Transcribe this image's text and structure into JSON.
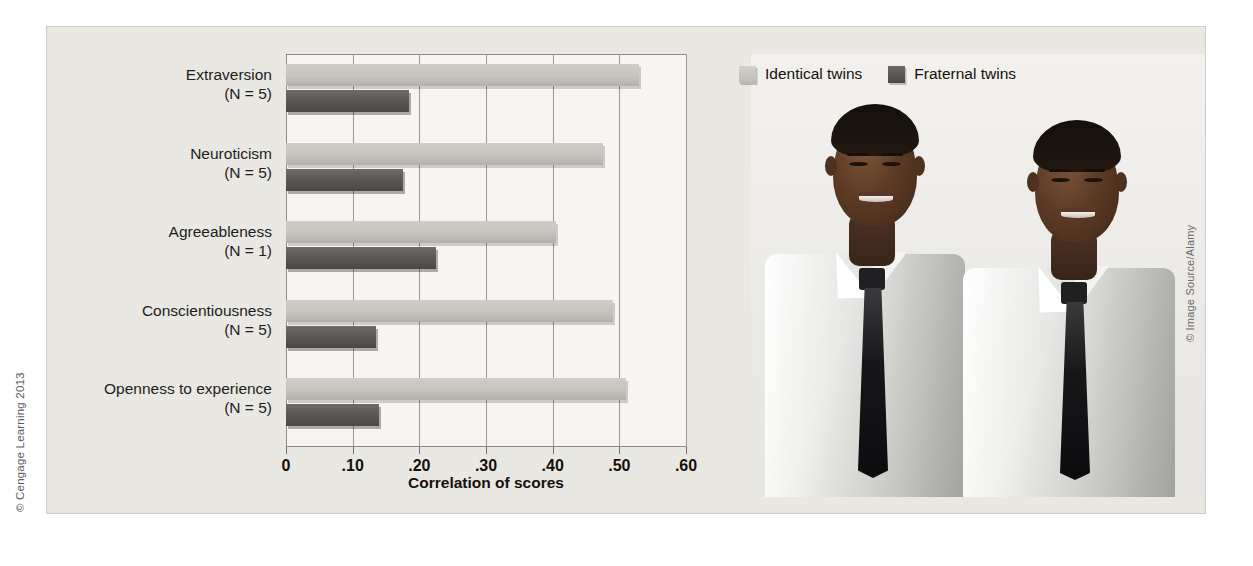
{
  "figure": {
    "credit_left": "© Cengage Learning 2013",
    "credit_right": "© Image Source/Alamy",
    "photo_alt": "photo-of-identical-twin-men-in-white-shirts-and-dark-ties"
  },
  "legend": {
    "items": [
      {
        "label": "Identical twins",
        "color": "#c6c4bf"
      },
      {
        "label": "Fraternal twins",
        "color": "#5a5855"
      }
    ]
  },
  "chart_data": {
    "type": "bar",
    "orientation": "horizontal",
    "title": "",
    "xlabel": "Correlation of scores",
    "ylabel": "",
    "xlim": [
      0,
      0.6
    ],
    "xticks": [
      0,
      0.1,
      0.2,
      0.3,
      0.4,
      0.5,
      0.6
    ],
    "xtick_labels": [
      "0",
      ".10",
      ".20",
      ".30",
      ".40",
      ".50",
      ".60"
    ],
    "grid": true,
    "legend_position": "top-right",
    "categories": [
      "Extraversion",
      "Neuroticism",
      "Agreeableness",
      "Conscientiousness",
      "Openness to experience"
    ],
    "category_notes": [
      "(N = 5)",
      "(N = 5)",
      "(N = 1)",
      "(N = 5)",
      "(N = 5)"
    ],
    "series": [
      {
        "name": "Identical twins",
        "color": "#c6c4bf",
        "values": [
          0.53,
          0.475,
          0.405,
          0.49,
          0.51
        ]
      },
      {
        "name": "Fraternal twins",
        "color": "#5a5855",
        "values": [
          0.185,
          0.175,
          0.225,
          0.135,
          0.14
        ]
      }
    ]
  }
}
